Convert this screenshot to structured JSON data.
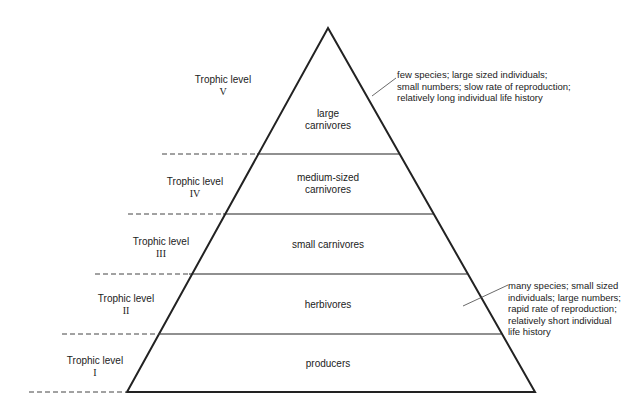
{
  "tiers": [
    {
      "level_label": "Trophic level",
      "level_numeral": "V",
      "name_lines": [
        "large",
        "carnivores"
      ]
    },
    {
      "level_label": "Trophic level",
      "level_numeral": "IV",
      "name_lines": [
        "medium-sized",
        "carnivores"
      ]
    },
    {
      "level_label": "Trophic level",
      "level_numeral": "III",
      "name_lines": [
        "small carnivores"
      ]
    },
    {
      "level_label": "Trophic level",
      "level_numeral": "II",
      "name_lines": [
        "herbivores"
      ]
    },
    {
      "level_label": "Trophic level",
      "level_numeral": "I",
      "name_lines": [
        "producers"
      ]
    }
  ],
  "annotations": {
    "top": [
      "few species; large sized individuals;",
      "small numbers; slow rate of reproduction;",
      "relatively long individual life history"
    ],
    "bottom": [
      "many species; small sized",
      "individuals; large numbers;",
      "rapid rate of reproduction;",
      "relatively short individual",
      "life history"
    ]
  },
  "colors": {
    "line": "#222222",
    "background": "#ffffff"
  }
}
